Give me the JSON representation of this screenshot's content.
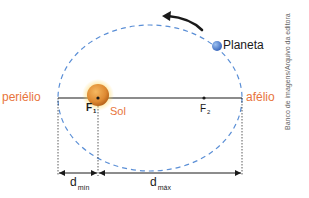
{
  "diagram": {
    "labels": {
      "perihelion": "periélio",
      "aphelion": "afélio",
      "planet": "Planeta",
      "sun": "Sol",
      "focus1": "F",
      "focus1_sub": "1",
      "focus2": "F",
      "focus2_sub": "2",
      "dmin": "d",
      "dmin_sub": "mín",
      "dmax": "d",
      "dmax_sub": "máx"
    },
    "credit": "Banco de imagens/Arquivo da editora",
    "colors": {
      "orbit": "#5b8fd6",
      "accent_text": "#e8743b",
      "sun": "#e08a2a",
      "planet": "#4a78c8",
      "lines": "#1a1a1a"
    }
  }
}
